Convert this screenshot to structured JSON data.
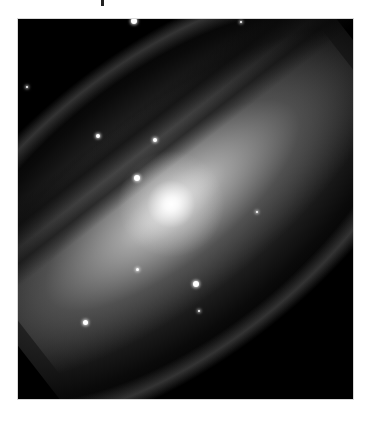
{
  "figure": {
    "colors": {
      "background": "#000000",
      "page": "#ffffff",
      "core": "#ffffff"
    },
    "stars": [
      {
        "x": 116,
        "y": 2,
        "r": 3
      },
      {
        "x": 223,
        "y": 3,
        "r": 1
      },
      {
        "x": 9,
        "y": 68,
        "r": 1
      },
      {
        "x": 80,
        "y": 117,
        "r": 2
      },
      {
        "x": 137,
        "y": 121,
        "r": 2
      },
      {
        "x": 119,
        "y": 159,
        "r": 3
      },
      {
        "x": 239,
        "y": 193,
        "r": 1
      },
      {
        "x": 119,
        "y": 250,
        "r": 1.5
      },
      {
        "x": 178,
        "y": 265,
        "r": 3
      },
      {
        "x": 181,
        "y": 292,
        "r": 1
      },
      {
        "x": 67,
        "y": 303,
        "r": 2.5
      }
    ]
  }
}
